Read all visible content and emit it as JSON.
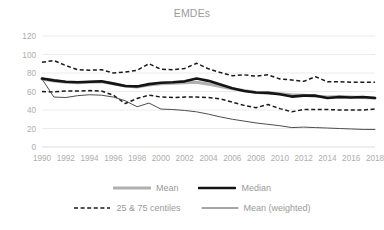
{
  "chart_data": {
    "type": "line",
    "title": "EMDEs",
    "xlabel": "",
    "ylabel": "",
    "ylim": [
      0,
      120
    ],
    "ytick_values": [
      0,
      20,
      40,
      60,
      80,
      100,
      120
    ],
    "ytick_labels": [
      "0",
      "20",
      "40",
      "60",
      "80",
      "100",
      "120"
    ],
    "grid": true,
    "legend_position": "bottom",
    "x": [
      1990,
      1991,
      1992,
      1993,
      1994,
      1995,
      1996,
      1997,
      1998,
      1999,
      2000,
      2001,
      2002,
      2003,
      2004,
      2005,
      2006,
      2007,
      2008,
      2009,
      2010,
      2011,
      2012,
      2013,
      2014,
      2015,
      2016,
      2017,
      2018
    ],
    "xtick_labels": [
      "1990",
      "1992",
      "1994",
      "1996",
      "1998",
      "2000",
      "2002",
      "2004",
      "2006",
      "2008",
      "2010",
      "2012",
      "2014",
      "2016",
      "2018"
    ],
    "xtick_values": [
      1990,
      1992,
      1994,
      1996,
      1998,
      2000,
      2002,
      2004,
      2006,
      2008,
      2010,
      2012,
      2014,
      2016,
      2018
    ],
    "series": [
      {
        "name": "Mean",
        "style": "thick-gray",
        "color": "#b0b0b0",
        "values": [
          73.5,
          71.5,
          70.0,
          69.5,
          70.0,
          70.5,
          68.5,
          66.0,
          65.0,
          67.0,
          68.5,
          69.0,
          69.5,
          70.0,
          68.0,
          65.5,
          63.0,
          61.0,
          59.0,
          58.5,
          57.5,
          56.5,
          56.0,
          55.0,
          54.0,
          54.5,
          54.0,
          53.5,
          53.0
        ]
      },
      {
        "name": "Median",
        "style": "thick-black",
        "color": "#141414",
        "values": [
          74.0,
          72.0,
          70.5,
          70.0,
          70.5,
          71.0,
          68.5,
          66.0,
          65.5,
          68.0,
          69.5,
          70.0,
          71.0,
          74.0,
          71.5,
          67.5,
          63.5,
          60.5,
          59.0,
          58.5,
          57.0,
          54.5,
          55.5,
          55.5,
          53.0,
          54.0,
          53.5,
          54.0,
          53.0
        ]
      },
      {
        "name": "25 & 75 centiles",
        "style": "dashed-black",
        "color": "#1a1a1a",
        "sublabel": "75th centile",
        "values": [
          91.5,
          93.5,
          88.0,
          83.5,
          83.0,
          83.5,
          80.0,
          81.0,
          83.0,
          90.0,
          84.0,
          83.5,
          85.0,
          90.5,
          84.5,
          80.5,
          77.0,
          78.0,
          76.5,
          78.0,
          73.5,
          72.5,
          71.0,
          76.0,
          70.5,
          70.5,
          70.0,
          70.0,
          70.0
        ]
      },
      {
        "name": "25 & 75 centiles",
        "style": "dashed-black",
        "color": "#1a1a1a",
        "sublabel": "25th centile",
        "values": [
          60.0,
          59.5,
          60.5,
          60.5,
          61.0,
          60.5,
          56.0,
          47.0,
          52.5,
          56.0,
          54.0,
          53.5,
          54.0,
          54.0,
          53.5,
          52.0,
          48.5,
          45.0,
          42.5,
          46.0,
          41.5,
          38.0,
          40.5,
          40.5,
          40.5,
          40.0,
          40.0,
          40.0,
          41.0
        ]
      },
      {
        "name": "Mean (weighted)",
        "style": "thin-black",
        "color": "#4d4d4d",
        "values": [
          73.5,
          54.0,
          53.5,
          55.5,
          56.5,
          56.0,
          54.0,
          50.0,
          43.5,
          47.5,
          41.0,
          40.5,
          39.5,
          38.0,
          35.5,
          32.5,
          30.0,
          28.0,
          26.0,
          24.5,
          23.0,
          21.0,
          21.5,
          21.0,
          20.5,
          20.0,
          19.5,
          19.0,
          19.0
        ]
      }
    ]
  },
  "legend": {
    "rows": [
      [
        {
          "label": "Mean",
          "style": "thick-gray"
        },
        {
          "label": "Median",
          "style": "thick-black"
        }
      ],
      [
        {
          "label": "25 & 75 centiles",
          "style": "dashed-black"
        },
        {
          "label": "Mean (weighted)",
          "style": "thin-black"
        }
      ]
    ]
  }
}
